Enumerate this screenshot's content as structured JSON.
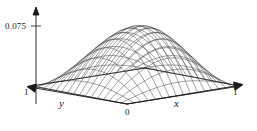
{
  "figure": {
    "name": "surface-plot",
    "background_color": "#ffffff",
    "line_color": "#2b2b2b",
    "axis_color": "#1a1a1a"
  },
  "labels": {
    "z_tick": "0.075",
    "y_end": "1",
    "x_end": "1",
    "origin": "0",
    "y_axis": "y",
    "x_axis": "x"
  },
  "chart_data": {
    "type": "line",
    "render": "wireframe-surface-3d",
    "title": "",
    "xlabel": "x",
    "ylabel": "y",
    "zlabel": "",
    "xlim": [
      0,
      1
    ],
    "ylim": [
      0,
      1
    ],
    "zlim": [
      0,
      0.075
    ],
    "x_ticks": [
      "0",
      "1"
    ],
    "y_ticks": [
      "0",
      "1"
    ],
    "z_ticks": [
      "0.075"
    ],
    "grid": false,
    "legend": null,
    "surface": {
      "description": "Dome-shaped surface over the unit square, zero on the boundary, single interior maximum near the center.",
      "formula": "z = A*sin(pi*x)*sin(pi*y)",
      "peak_value": 0.075,
      "peak_at": [
        0.5,
        0.5
      ],
      "boundary_value": 0,
      "mesh_divisions_x": 16,
      "mesh_divisions_y": 16
    },
    "projection": {
      "origin_px": [
        127,
        104
      ],
      "x_axis_end_px": [
        240,
        86
      ],
      "y_axis_end_px": [
        32,
        86
      ],
      "z_axis_top_px": [
        36,
        10
      ],
      "z_tick_px": [
        36,
        26
      ]
    },
    "x": [
      0,
      0.0625,
      0.125,
      0.1875,
      0.25,
      0.3125,
      0.375,
      0.4375,
      0.5,
      0.5625,
      0.625,
      0.6875,
      0.75,
      0.8125,
      0.875,
      0.9375,
      1
    ],
    "y": [
      0,
      0.0625,
      0.125,
      0.1875,
      0.25,
      0.3125,
      0.375,
      0.4375,
      0.5,
      0.5625,
      0.625,
      0.6875,
      0.75,
      0.8125,
      0.875,
      0.9375,
      1
    ],
    "z_profile_center_row": [
      0,
      0.0147,
      0.0287,
      0.0416,
      0.053,
      0.0624,
      0.0694,
      0.0738,
      0.075,
      0.0738,
      0.0694,
      0.0624,
      0.053,
      0.0416,
      0.0287,
      0.0147,
      0
    ]
  }
}
